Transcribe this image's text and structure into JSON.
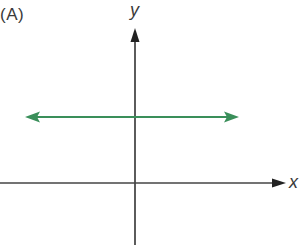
{
  "diagram": {
    "panel_label": "(A)",
    "axes": {
      "x_label": "x",
      "y_label": "y",
      "axis_color": "#333333"
    },
    "line": {
      "description": "horizontal line with arrows at both ends",
      "color": "#3a8f5a"
    }
  }
}
